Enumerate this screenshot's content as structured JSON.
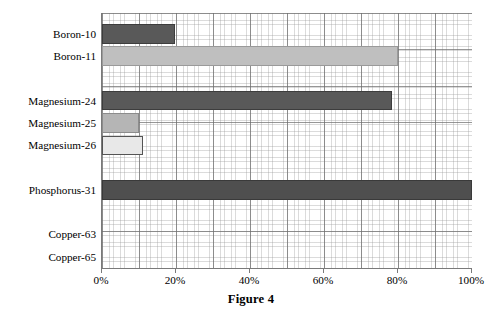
{
  "chart_data": {
    "type": "bar",
    "orientation": "horizontal",
    "title": "Figure 4",
    "xlabel": "",
    "ylabel": "",
    "xlim": [
      0,
      100
    ],
    "xunit": "%",
    "grid": true,
    "grid_style": "graph-paper minor and major gridlines",
    "legend": "none",
    "categories": [
      "Boron-10",
      "Boron-11",
      "",
      "Magnesium-24",
      "Magnesium-25",
      "Magnesium-26",
      "",
      "Phosphorus-31",
      "",
      "Copper-63",
      "Copper-65"
    ],
    "values": [
      19.8,
      80.0,
      null,
      78.5,
      10.0,
      11.0,
      null,
      100.0,
      null,
      0,
      0
    ],
    "bars": [
      {
        "label": "Boron-10",
        "value": 19.8,
        "fill": "#595959",
        "stroke": "#3d3d3d",
        "slot": 1
      },
      {
        "label": "Boron-11",
        "value": 80.0,
        "fill": "#bfbfbf",
        "stroke": "#9a9a9a",
        "slot": 2
      },
      {
        "label": "Magnesium-24",
        "value": 78.5,
        "fill": "#595959",
        "stroke": "#3d3d3d",
        "slot": 4
      },
      {
        "label": "Magnesium-25",
        "value": 10.0,
        "fill": "#b5b5b5",
        "stroke": "#8c8c8c",
        "slot": 5
      },
      {
        "label": "Magnesium-26",
        "value": 11.0,
        "fill": "#e8e8e8",
        "stroke": "#545454",
        "slot": 6
      },
      {
        "label": "Phosphorus-31",
        "value": 100.0,
        "fill": "#4f4f4f",
        "stroke": "#3a3a3a",
        "slot": 8
      },
      {
        "label": "Copper-63",
        "value": 0,
        "fill": "#595959",
        "stroke": "#3d3d3d",
        "slot": 10
      },
      {
        "label": "Copper-65",
        "value": 0,
        "fill": "#bfbfbf",
        "stroke": "#9a9a9a",
        "slot": 11
      }
    ],
    "xticks": [
      {
        "value": 0,
        "label": "0%"
      },
      {
        "value": 20,
        "label": "20%"
      },
      {
        "value": 40,
        "label": "40%"
      },
      {
        "value": 60,
        "label": "60%"
      },
      {
        "value": 80,
        "label": "80%"
      },
      {
        "value": 100,
        "label": "100%"
      }
    ],
    "colors": {
      "dark_gray": "#595959",
      "medium_gray": "#bfbfbf",
      "light_gray": "#e8e8e8",
      "axis": "#7a7a7a",
      "grid_major": "#6e6e6e",
      "grid_minor": "#969696",
      "background": "#ffffff",
      "text": "#000000"
    }
  },
  "caption": {
    "text": "Figure 4"
  }
}
